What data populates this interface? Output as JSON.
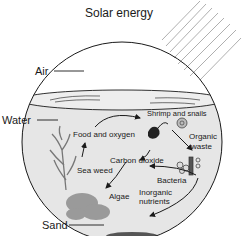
{
  "title": "Solar energy",
  "labels": {
    "air": "Air",
    "water": "Water",
    "sand": "Sand"
  },
  "cycle": {
    "food_oxygen": "Food and oxygen",
    "shrimp_snails": "Shrimp and snails",
    "organic": "Organic",
    "waste": "waste",
    "carbon_dioxide": "Carbon dioxide",
    "sea_weed": "Sea weed",
    "bacteria": "Bacteria",
    "algae": "Algae",
    "inorganic": "Inorganic",
    "nutrients": "nutrients"
  },
  "colors": {
    "water": "#e6e6e6",
    "outline": "#1a1a1a",
    "plant": "#8a8a8a",
    "rays": "#9a9a9a"
  }
}
